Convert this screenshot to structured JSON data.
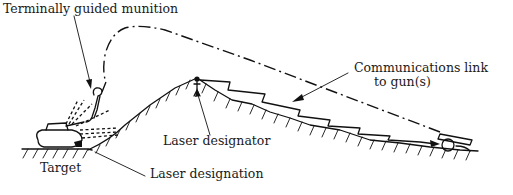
{
  "diagram": {
    "labels": {
      "munition": "Terminally guided munition",
      "comms_line1": "Communications link",
      "comms_line2": "to gun(s)",
      "designator": "Laser designator",
      "target": "Target",
      "designation": "Laser designation"
    },
    "elements": [
      {
        "id": "target-tank",
        "role": "target"
      },
      {
        "id": "munition",
        "role": "terminally guided projectile descending on target"
      },
      {
        "id": "laser-designator",
        "role": "observer on mountain peak"
      },
      {
        "id": "laser-reflections",
        "role": "dashed reflected laser energy from target"
      },
      {
        "id": "trajectory",
        "role": "dash-dot projectile trajectory from gun to target"
      },
      {
        "id": "comms-link",
        "role": "zigzag communications link from designator to gun"
      },
      {
        "id": "gun",
        "role": "artillery piece at right"
      }
    ],
    "colors": {
      "ink": "#111111",
      "background": "#ffffff"
    }
  }
}
